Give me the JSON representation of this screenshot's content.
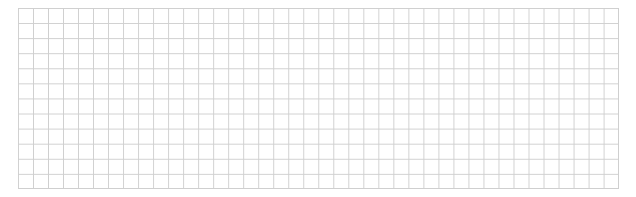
{
  "grid": {
    "columns": 40,
    "rows": 12,
    "line_color": "#cfcfcf",
    "background": "#ffffff"
  }
}
